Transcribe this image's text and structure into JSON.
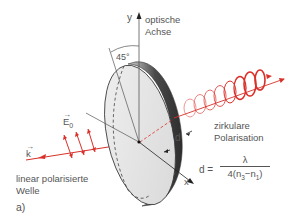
{
  "figure": {
    "panel_label": "a)",
    "axis_y_label": "y",
    "axis_x_label": "x",
    "optic_axis_label_line1": "optische",
    "optic_axis_label_line2": "Achse",
    "angle_label": "45°",
    "field_label": "E",
    "field_subscript": "0",
    "wavevector_label": "k",
    "thickness_label": "d",
    "input_label_line1": "linear polarisierte",
    "input_label_line2": "Welle",
    "output_label_line1": "zirkulare",
    "output_label_line2": "Polarisation",
    "formula_lhs": "d =",
    "formula_numerator": "λ",
    "formula_denominator": "4(n3−n1)",
    "formula_denominator_parts": {
      "prefix": "4(n",
      "sub1": "3",
      "mid": "−n",
      "sub2": "1",
      "suffix": ")"
    },
    "colors": {
      "beam": "#d9302a",
      "plate_face": "#e6e6e6",
      "plate_edge": "#3a3a3a",
      "lines": "#555555"
    }
  }
}
